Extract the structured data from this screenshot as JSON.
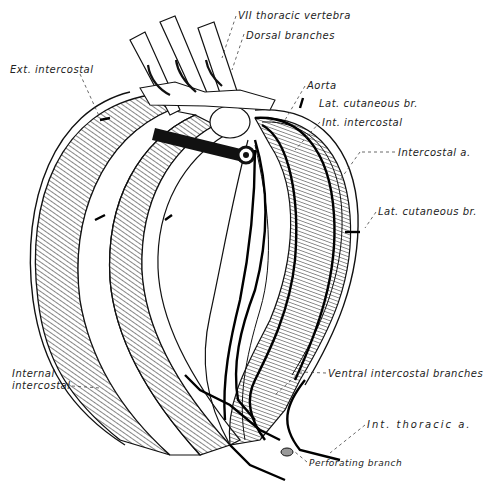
{
  "figure": {
    "colors": {
      "ink": "#111111",
      "bone": "#ffffff",
      "paper": "#ffffff",
      "label": "#222222"
    }
  },
  "labels": [
    {
      "id": "vii-thoracic-vertebra",
      "text": "VII thoracic  vertebra",
      "x": 238,
      "y": 10
    },
    {
      "id": "dorsal-branches",
      "text": "Dorsal branches",
      "x": 246,
      "y": 30
    },
    {
      "id": "ext-intercostal",
      "text": "Ext. intercostal",
      "x": 10,
      "y": 64
    },
    {
      "id": "aorta",
      "text": "Aorta",
      "x": 307,
      "y": 80
    },
    {
      "id": "lat-cutaneous-br-upper",
      "text": "Lat. cutaneous br.",
      "x": 319,
      "y": 98
    },
    {
      "id": "int-intercostal",
      "text": "Int. intercostal",
      "x": 322,
      "y": 117
    },
    {
      "id": "intercostal-a",
      "text": "Intercostal a.",
      "x": 398,
      "y": 149
    },
    {
      "id": "lat-cutaneous-br-lower",
      "text": "Lat. cutaneous br.",
      "x": 378,
      "y": 208
    },
    {
      "id": "internal-intercostal-1",
      "text": "Internal",
      "x": 12,
      "y": 369
    },
    {
      "id": "internal-intercostal-2",
      "text": "intercostal",
      "x": 12,
      "y": 381
    },
    {
      "id": "ventral-intercostal-branches",
      "text": "Ventral intercostal branches",
      "x": 328,
      "y": 369
    },
    {
      "id": "int-thoracic-a",
      "text": "Int.  thoracic  a.",
      "x": 367,
      "y": 420
    },
    {
      "id": "perforating-branch",
      "text": "Perforating branch",
      "x": 309,
      "y": 459
    }
  ]
}
